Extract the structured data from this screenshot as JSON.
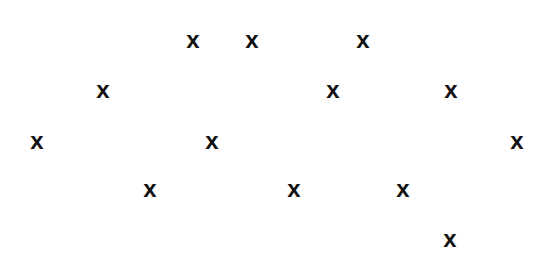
{
  "canvas": {
    "width": 550,
    "height": 262,
    "background": "#ffffff",
    "mark_color": "#111111"
  },
  "marks": [
    {
      "label": "x",
      "x": 193,
      "y": 40
    },
    {
      "label": "x",
      "x": 252,
      "y": 40
    },
    {
      "label": "x",
      "x": 363,
      "y": 40
    },
    {
      "label": "x",
      "x": 103,
      "y": 90
    },
    {
      "label": "x",
      "x": 333,
      "y": 90
    },
    {
      "label": "x",
      "x": 451,
      "y": 90
    },
    {
      "label": "x",
      "x": 37,
      "y": 141
    },
    {
      "label": "x",
      "x": 212,
      "y": 141
    },
    {
      "label": "x",
      "x": 517,
      "y": 141
    },
    {
      "label": "x",
      "x": 150,
      "y": 189
    },
    {
      "label": "x",
      "x": 294,
      "y": 189
    },
    {
      "label": "x",
      "x": 403,
      "y": 189
    },
    {
      "label": "x",
      "x": 450,
      "y": 239
    }
  ]
}
